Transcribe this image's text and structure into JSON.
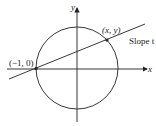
{
  "diagram": {
    "axes": {
      "x_label": "x",
      "y_label": "y"
    },
    "point_left_label": "(−1, 0)",
    "point_right_label": "(x, y)",
    "line_label": "Slope t",
    "colors": {
      "stroke": "#222222",
      "background": "#ffffff"
    }
  }
}
